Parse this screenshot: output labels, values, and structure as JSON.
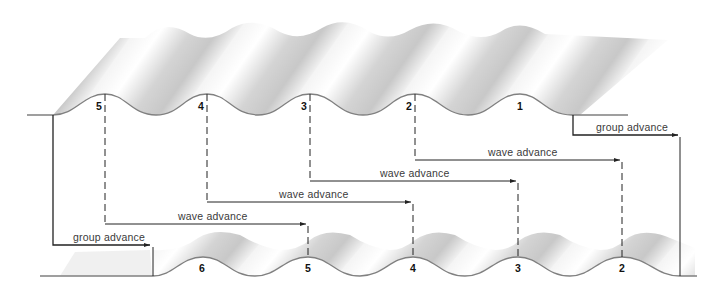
{
  "diagram": {
    "type": "wave-group-propagation",
    "colors": {
      "wave_line": "#808080",
      "arrow": "#222222",
      "shade": "#c8c8c8",
      "label": "#3a3a3a"
    },
    "top_wave": {
      "crest_labels": [
        "5",
        "4",
        "3",
        "2",
        "1"
      ]
    },
    "bottom_wave": {
      "crest_labels": [
        "6",
        "5",
        "4",
        "3",
        "2"
      ]
    },
    "arrows": [
      {
        "id": "group-advance-right",
        "label": "group advance"
      },
      {
        "id": "wave-advance-2",
        "label": "wave advance"
      },
      {
        "id": "wave-advance-3",
        "label": "wave advance"
      },
      {
        "id": "wave-advance-4",
        "label": "wave advance"
      },
      {
        "id": "wave-advance-5",
        "label": "wave advance"
      },
      {
        "id": "group-advance-left",
        "label": "group advance"
      }
    ]
  }
}
